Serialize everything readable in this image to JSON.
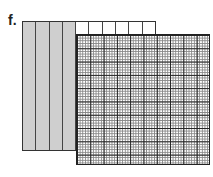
{
  "label": "f.",
  "back_model": {
    "columns": 10,
    "shaded_columns": 4,
    "shade_color": "#cfcfcf"
  },
  "front_model": {
    "rows": 10,
    "columns": 10,
    "subdivisions": 5,
    "description": "hundredths grid"
  }
}
